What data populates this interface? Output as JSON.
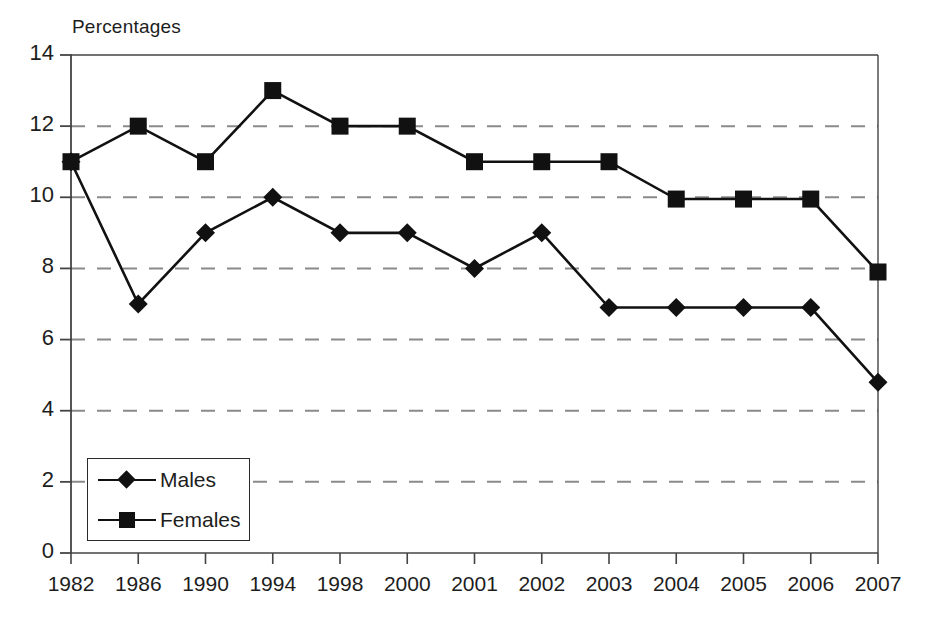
{
  "chart_data": {
    "type": "line",
    "title": "",
    "ylabel": "Percentages",
    "xlabel": "",
    "ylim": [
      0,
      14
    ],
    "ytick_step": 2,
    "yticks": [
      "0",
      "2",
      "4",
      "6",
      "8",
      "10",
      "12",
      "14"
    ],
    "grid": "horizontal-dashed",
    "legend_position": "lower-left-inside",
    "categories": [
      "1982",
      "1986",
      "1990",
      "1994",
      "1998",
      "2000",
      "2001",
      "2002",
      "2003",
      "2004",
      "2005",
      "2006",
      "2007"
    ],
    "series": [
      {
        "name": "Males",
        "marker": "diamond",
        "color": "#111111",
        "values": [
          11,
          7,
          9,
          10,
          9,
          9,
          8,
          9,
          6.9,
          6.9,
          6.9,
          6.9,
          4.8
        ]
      },
      {
        "name": "Females",
        "marker": "square",
        "color": "#111111",
        "values": [
          11,
          12,
          11,
          13,
          12,
          12,
          11,
          11,
          11,
          9.95,
          9.95,
          9.95,
          7.9
        ]
      }
    ]
  },
  "axes": {
    "title_text": "Percentages"
  },
  "legend": {
    "entries": [
      {
        "label": "Males",
        "marker": "diamond"
      },
      {
        "label": "Females",
        "marker": "square"
      }
    ]
  },
  "colors": {
    "line": "#111111",
    "grid": "#8a8a8a",
    "axis": "#444444",
    "text": "#1d1d1d",
    "background": "#ffffff"
  }
}
